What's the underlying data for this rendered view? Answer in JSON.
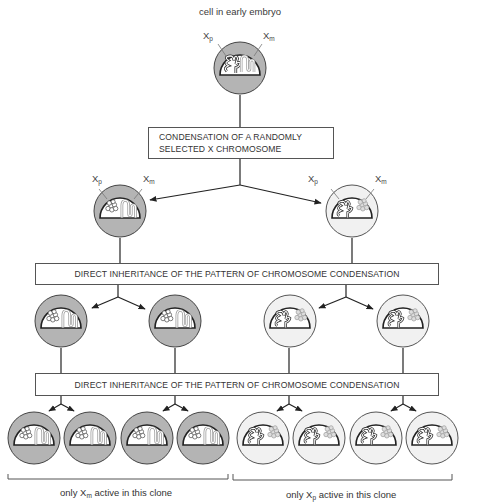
{
  "title": "cell in early embryo",
  "boxes": {
    "condensation": {
      "line1": "CONDENSATION OF A RANDOMLY",
      "line2": "SELECTED X CHROMOSOME"
    },
    "inheritance_1": "DIRECT INHERITANCE OF THE PATTERN OF CHROMOSOME CONDENSATION",
    "inheritance_2": "DIRECT INHERITANCE OF THE PATTERN OF CHROMOSOME CONDENSATION"
  },
  "chromosome_labels": {
    "paternal_base": "X",
    "paternal_sub": "p",
    "maternal_base": "X",
    "maternal_sub": "m"
  },
  "captions": {
    "left": {
      "prefix": "only X",
      "sub": "m",
      "suffix": " active in this clone"
    },
    "right": {
      "prefix": "only X",
      "sub": "p",
      "suffix": " active in this clone"
    }
  },
  "colors": {
    "gray_cell_fill": "#b4b4b4",
    "gray_cell_cytoplasm": "#a9a9a9",
    "light_cell_fill": "#f1f1f1",
    "light_cell_cytoplasm": "#e2e2e2",
    "outline": "#444444",
    "condensed_chromosome": "#8c8c8c",
    "active_xm_stroke": "#9a9a9a"
  },
  "cells": {
    "root": {
      "type": "both-active"
    },
    "level2": [
      {
        "type": "xp-inactive",
        "clone": "left"
      },
      {
        "type": "xm-inactive",
        "clone": "right"
      }
    ],
    "level3": [
      {
        "type": "xp-inactive"
      },
      {
        "type": "xp-inactive"
      },
      {
        "type": "xm-inactive"
      },
      {
        "type": "xm-inactive"
      }
    ],
    "level4": [
      {
        "type": "xp-inactive"
      },
      {
        "type": "xp-inactive"
      },
      {
        "type": "xp-inactive"
      },
      {
        "type": "xp-inactive"
      },
      {
        "type": "xm-inactive"
      },
      {
        "type": "xm-inactive"
      },
      {
        "type": "xm-inactive"
      },
      {
        "type": "xm-inactive"
      }
    ]
  }
}
